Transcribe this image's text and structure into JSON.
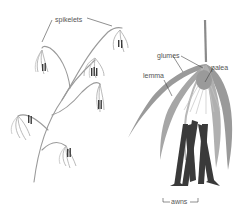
{
  "diagram": {
    "type": "botanical-illustration",
    "labels": {
      "spikelets": "spikelets",
      "glumes": "glumes",
      "lemma": "lemma",
      "palea": "palea",
      "awns": "awns"
    },
    "colors": {
      "background": "#ffffff",
      "stem": "#8a8a8a",
      "bract": "#9a9a9a",
      "bract_light": "#c8c8c8",
      "awn_dark": "#3a3a3a",
      "label_text": "#555555",
      "leader_line": "#444444"
    }
  }
}
